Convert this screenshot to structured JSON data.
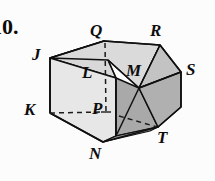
{
  "problem": {
    "number": "10."
  },
  "figure": {
    "name": "labeled-solid-diagram",
    "colors": {
      "outline": "#101010",
      "top_face": "#d8d8d8",
      "top_right_face": "#c6c6c6",
      "left_face": "#e6e6e6",
      "front_left_face": "#dedede",
      "right_face": "#a9a9a9",
      "front_right_face": "#b4b4b4",
      "hidden_edge": "#1a1a1a",
      "background": "#fcfcfc"
    },
    "vertices": [
      {
        "id": "Q",
        "label": "Q",
        "x": 90,
        "y": 22
      },
      {
        "id": "R",
        "label": "R",
        "x": 150,
        "y": 22
      },
      {
        "id": "J",
        "label": "J",
        "x": 32,
        "y": 46
      },
      {
        "id": "L",
        "label": "L",
        "x": 82,
        "y": 64
      },
      {
        "id": "M",
        "label": "M",
        "x": 126,
        "y": 62
      },
      {
        "id": "S",
        "label": "S",
        "x": 186,
        "y": 61
      },
      {
        "id": "K",
        "label": "K",
        "x": 24,
        "y": 101
      },
      {
        "id": "P",
        "label": "P",
        "x": 92,
        "y": 100
      },
      {
        "id": "N",
        "label": "N",
        "x": 89,
        "y": 145
      },
      {
        "id": "T",
        "label": "T",
        "x": 157,
        "y": 129
      }
    ],
    "geometry": {
      "point_J": [
        50,
        58
      ],
      "point_Q": [
        104,
        41
      ],
      "point_R": [
        160,
        45
      ],
      "point_S": [
        181,
        72
      ],
      "point_K": [
        48,
        113
      ],
      "point_N": [
        103,
        142
      ],
      "point_T": [
        158,
        127
      ],
      "point_ridge_top": [
        108,
        60
      ],
      "point_M_vertex": [
        139,
        88
      ],
      "point_P_hidden": [
        106,
        112
      ],
      "point_mid_front": [
        116,
        136
      ]
    }
  }
}
